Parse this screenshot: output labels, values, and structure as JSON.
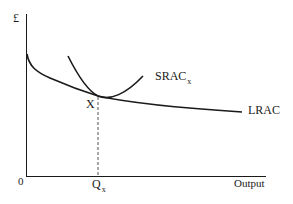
{
  "diagram": {
    "type": "cost-curves",
    "y_axis_label": "£",
    "x_axis_label": "Output",
    "origin_label": "0",
    "point_label": "X",
    "quantity_label": {
      "main": "Q",
      "sub": "x"
    },
    "curves": [
      {
        "id": "lrac",
        "label": "LRAC",
        "shape": "downward-sloping, flattening"
      },
      {
        "id": "srac",
        "label": {
          "main": "SRAC",
          "sub": "x"
        },
        "shape": "U-shaped, tangent to LRAC at X"
      }
    ],
    "tangency": {
      "point": "X",
      "output": "Qx",
      "dashed_drop_line": true
    },
    "colors": {
      "line": "#1a1a1a",
      "background": "#ffffff"
    }
  }
}
